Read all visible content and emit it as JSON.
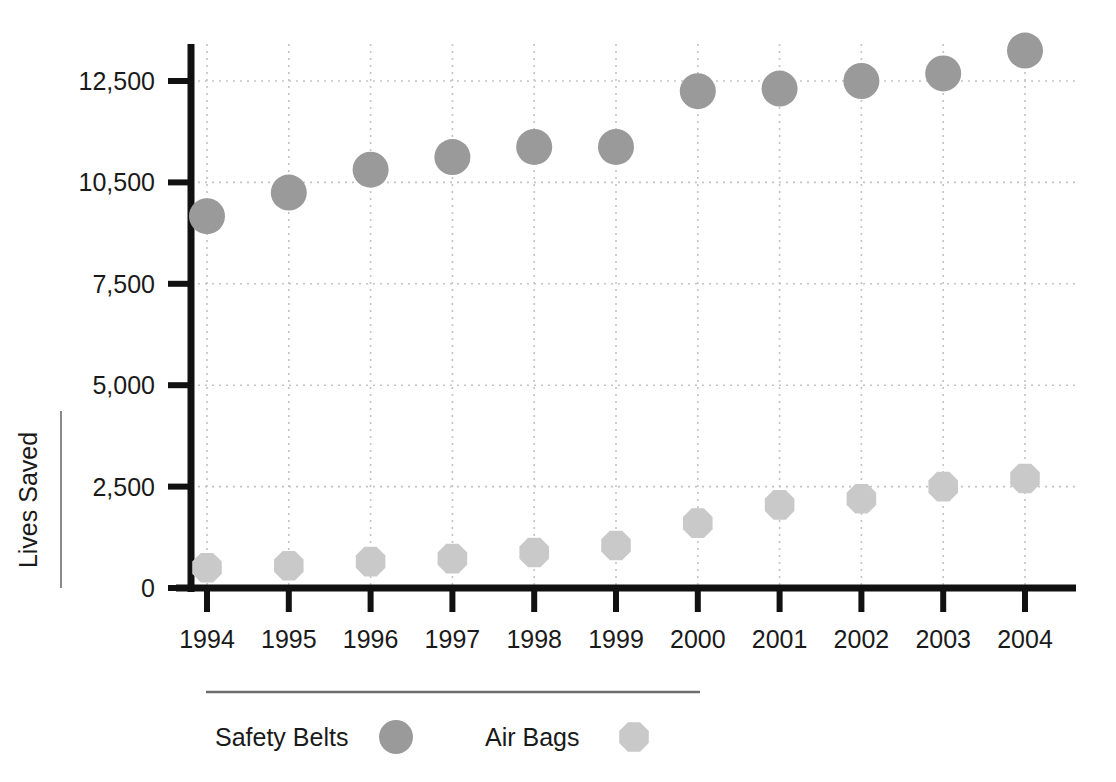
{
  "chart_data": {
    "type": "scatter",
    "title": "",
    "subtitle": "",
    "xlabel": "",
    "ylabel": "Lives Saved",
    "categories": [
      "1994",
      "1995",
      "1996",
      "1997",
      "1998",
      "1999",
      "2000",
      "2001",
      "2002",
      "2003",
      "2004"
    ],
    "y_tick_labels": [
      "0",
      "2,500",
      "5,000",
      "7,500",
      "10,500",
      "12,500"
    ],
    "y_tick_values": [
      0,
      2500,
      5000,
      7500,
      10500,
      12500
    ],
    "ylim": [
      0,
      13500
    ],
    "y_axis_note": "Tick marks are evenly spaced in pixels although the 7,500 to 10,500 interval spans 3,000 while all other intervals span 2,500",
    "grid": true,
    "grid_orientation": "both",
    "legend_position": "bottom",
    "series": [
      {
        "name": "Safety Belts",
        "marker": "circle",
        "color": "#9a9a9a",
        "values": [
          9500,
          10200,
          10750,
          11000,
          11200,
          11200,
          12300,
          12350,
          12500,
          12650,
          13100
        ]
      },
      {
        "name": "Air Bags",
        "marker": "octagon",
        "color": "#c9c9c9",
        "values": [
          500,
          550,
          650,
          725,
          875,
          1050,
          1600,
          2050,
          2200,
          2500,
          2700
        ]
      }
    ]
  },
  "legend": {
    "items": [
      {
        "label": "Safety Belts",
        "marker": "circle",
        "color": "#9a9a9a"
      },
      {
        "label": "Air Bags",
        "marker": "octagon",
        "color": "#c9c9c9"
      }
    ]
  },
  "colors": {
    "safety_belts": "#9a9a9a",
    "air_bags": "#c9c9c9",
    "axis": "#111111",
    "gridline": "#c4c4c4",
    "text": "#1a1a1a",
    "background": "#ffffff"
  }
}
